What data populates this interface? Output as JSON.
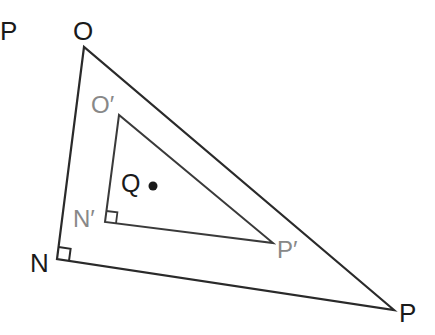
{
  "diagram": {
    "type": "geometry",
    "colors": {
      "outer_stroke": "#2a2a2a",
      "inner_stroke": "#3a3a3a",
      "outer_label": "#1a1a1a",
      "inner_label": "#888888",
      "point": "#1a1a1a"
    },
    "outer_triangle": {
      "vertices": {
        "O": {
          "x": 84,
          "y": 47
        },
        "N": {
          "x": 57,
          "y": 259
        },
        "P": {
          "x": 394,
          "y": 310
        }
      },
      "right_angle_at": "N",
      "labels": {
        "O": "O",
        "N": "N",
        "P": "P"
      }
    },
    "inner_triangle": {
      "vertices": {
        "O'": {
          "x": 119,
          "y": 115
        },
        "N'": {
          "x": 105,
          "y": 222
        },
        "P'": {
          "x": 273,
          "y": 243
        }
      },
      "right_angle_at": "N'",
      "labels": {
        "O'": "O′",
        "N'": "N′",
        "P'": "P′"
      }
    },
    "center_point": {
      "label": "Q",
      "x": 153,
      "y": 186
    },
    "stray_label": "P"
  }
}
